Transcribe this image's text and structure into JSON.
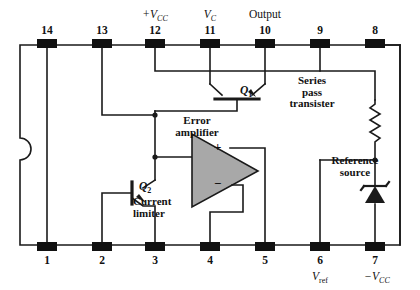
{
  "diagram": {
    "package": {
      "notch": "left-edge-semicircle"
    },
    "colors": {
      "line": "#1a1a1a",
      "pin_fill": "#111111",
      "opamp_fill": "#a8a8a8",
      "background": "#ffffff"
    },
    "top_pins": [
      {
        "number": "14",
        "name": ""
      },
      {
        "number": "13",
        "name": ""
      },
      {
        "number": "12",
        "name": "+V",
        "name_sub": "CC"
      },
      {
        "number": "11",
        "name": "V",
        "name_sub": "C"
      },
      {
        "number": "10",
        "name": "Output",
        "name_sub": ""
      },
      {
        "number": "9",
        "name": ""
      },
      {
        "number": "8",
        "name": ""
      }
    ],
    "bottom_pins": [
      {
        "number": "1",
        "name": "",
        "name_sub": ""
      },
      {
        "number": "2",
        "name": "",
        "name_sub": ""
      },
      {
        "number": "3",
        "name": "",
        "name_sub": ""
      },
      {
        "number": "4",
        "name": "",
        "name_sub": ""
      },
      {
        "number": "5",
        "name": "",
        "name_sub": ""
      },
      {
        "number": "6",
        "name": "V",
        "name_sub": "ref"
      },
      {
        "number": "7",
        "name": "−V",
        "name_sub": "CC"
      }
    ],
    "components": {
      "q1_label": "Q",
      "q1_sub": "1",
      "q1_caption_line1": "Series",
      "q1_caption_line2": "pass",
      "q1_caption_line3": "transister",
      "q2_label": "Q",
      "q2_sub": "2",
      "q2_caption_line1": "Current",
      "q2_caption_line2": "limiter",
      "opamp_line1": "Error",
      "opamp_line2": "amplifier",
      "opamp_plus": "+",
      "opamp_minus": "−",
      "reference_line1": "Reference",
      "reference_line2": "source"
    }
  }
}
